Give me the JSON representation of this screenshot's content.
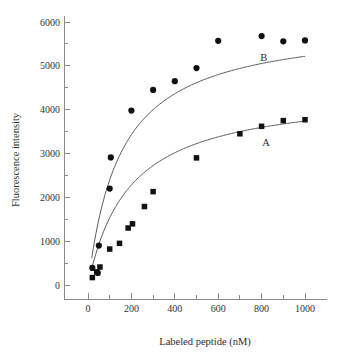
{
  "chart_data": {
    "type": "scatter",
    "title": "",
    "xlabel": "Labeled peptide (nM)",
    "ylabel": "Fluorescence intensity",
    "xlim": [
      -100,
      1070
    ],
    "ylim": [
      -250,
      6250
    ],
    "xticks": [
      0,
      200,
      400,
      600,
      800,
      1000
    ],
    "xticklabels": [
      "0",
      "200",
      "400",
      "600",
      "800",
      "1000"
    ],
    "xminorticks": [
      100,
      300,
      500,
      700,
      900
    ],
    "yticks": [
      0,
      1000,
      2000,
      3000,
      4000,
      5000,
      6000
    ],
    "yticklabels": [
      "0",
      "1000",
      "2000",
      "3000",
      "4000",
      "5000",
      "6000"
    ],
    "yminorticks": [
      500,
      1500,
      2500,
      3500,
      4500,
      5500
    ],
    "grid": false,
    "legend_position": "inline-annotation",
    "series": [
      {
        "name": "A",
        "marker": "square",
        "annotation": "A",
        "annotation_x": 820,
        "annotation_y": 3180,
        "fit_model": "hyperbolic saturation",
        "fit_vmax": 4450,
        "fit_kd": 190,
        "points": [
          {
            "x": 20,
            "y": 170
          },
          {
            "x": 40,
            "y": 300
          },
          {
            "x": 55,
            "y": 410
          },
          {
            "x": 100,
            "y": 820
          },
          {
            "x": 145,
            "y": 950
          },
          {
            "x": 185,
            "y": 1300
          },
          {
            "x": 205,
            "y": 1395
          },
          {
            "x": 260,
            "y": 1790
          },
          {
            "x": 300,
            "y": 2130
          },
          {
            "x": 500,
            "y": 2900
          },
          {
            "x": 700,
            "y": 3450
          },
          {
            "x": 800,
            "y": 3620
          },
          {
            "x": 900,
            "y": 3750
          },
          {
            "x": 1000,
            "y": 3770
          }
        ]
      },
      {
        "name": "B",
        "marker": "circle",
        "annotation": "B",
        "annotation_x": 810,
        "annotation_y": 5120,
        "fit_model": "hyperbolic saturation",
        "fit_vmax": 6000,
        "fit_kd": 150,
        "points": [
          {
            "x": 20,
            "y": 390
          },
          {
            "x": 45,
            "y": 275
          },
          {
            "x": 50,
            "y": 900
          },
          {
            "x": 100,
            "y": 2200
          },
          {
            "x": 105,
            "y": 2910
          },
          {
            "x": 200,
            "y": 3980
          },
          {
            "x": 300,
            "y": 4450
          },
          {
            "x": 400,
            "y": 4650
          },
          {
            "x": 500,
            "y": 4950
          },
          {
            "x": 600,
            "y": 5570
          },
          {
            "x": 800,
            "y": 5680
          },
          {
            "x": 900,
            "y": 5560
          },
          {
            "x": 1000,
            "y": 5580
          }
        ]
      }
    ],
    "colors": {
      "marker": "#111111",
      "curve": "#4a4a4a",
      "axis": "#8a8a8a",
      "text": "#2b2b2b",
      "background": "#ffffff"
    }
  }
}
